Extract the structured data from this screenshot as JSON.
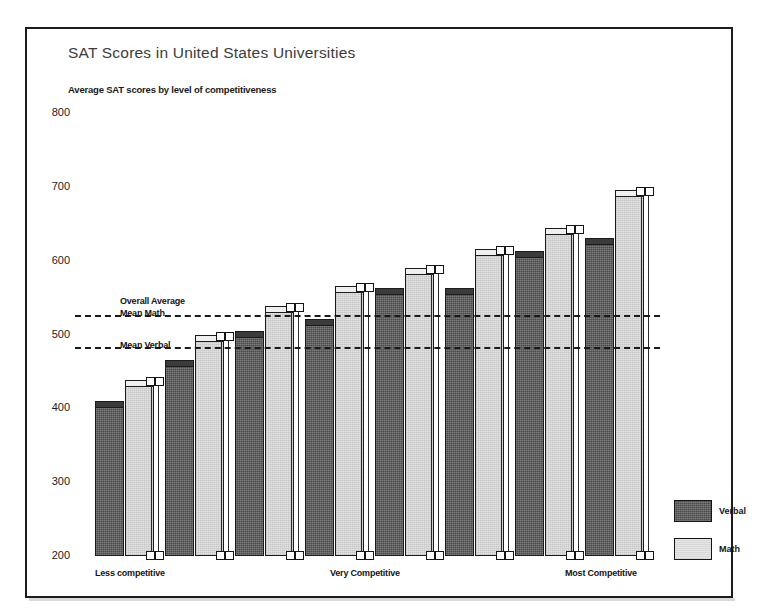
{
  "page": {
    "cropped_heading": "",
    "legend_labels": [
      "Verbal",
      "Math"
    ]
  },
  "chart_data": {
    "type": "bar",
    "title": "SAT Scores in United States Universities",
    "subtitle": "Average SAT scores by level of competitiveness",
    "xlabel": "",
    "ylabel": "",
    "ylim": [
      200,
      800
    ],
    "yticks": [
      200,
      300,
      400,
      500,
      600,
      700,
      800
    ],
    "ytick_labels": [
      "200",
      "300",
      "400",
      "500",
      "600",
      "700",
      "800"
    ],
    "grid": false,
    "legend_position": "right-bottom",
    "categories": [
      "Less competitive",
      "Less competitive 2",
      "Less competitive 3",
      "Very Competitive",
      "Very Competitive 2",
      "Very Competitive 3",
      "Most Competitive",
      "Most Competitive 2"
    ],
    "xtick_labels": [
      "Less competitive",
      "Very Competitive",
      "Most Competitive"
    ],
    "series": [
      {
        "name": "Verbal",
        "values": [
          402,
          457,
          497,
          513,
          555,
          555,
          605,
          622
        ]
      },
      {
        "name": "Math",
        "values": [
          430,
          491,
          530,
          558,
          582,
          607,
          636,
          688
        ]
      }
    ],
    "reference_lines": [
      {
        "label": "Overall Average\nMean Math",
        "label_line1": "Overall Average",
        "label_line2": "Mean Math",
        "value": 526
      },
      {
        "label": "Mean Verbal",
        "label_line1": "Mean Verbal",
        "value": 483
      }
    ],
    "annotations": [
      "Overall Average",
      "Mean Math",
      "Mean Verbal"
    ]
  }
}
